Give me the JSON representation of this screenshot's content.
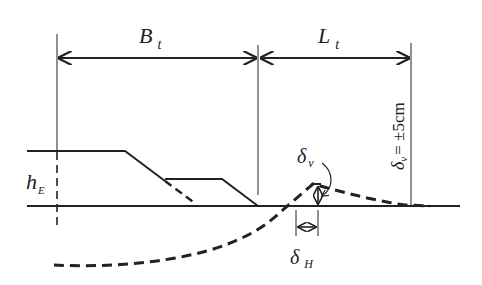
{
  "diagram": {
    "title": "",
    "labels": {
      "Bt_main": "B",
      "Bt_sub": "t",
      "Lt_main": "L",
      "Lt_sub": "t",
      "hE_main": "h",
      "hE_sub": "E",
      "dv_main": "δ",
      "dv_sub": "v",
      "dH_main": "δ",
      "dH_sub": "H",
      "limit_main": "δ",
      "limit_sub": "v",
      "limit_rest": "= ±5cm"
    },
    "colors": {
      "line": "#222222",
      "background": "#ffffff"
    }
  }
}
